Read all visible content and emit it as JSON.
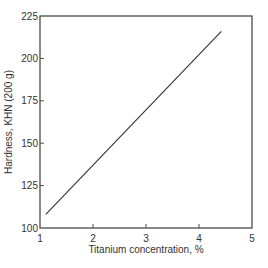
{
  "chart_data": {
    "type": "line",
    "title": "",
    "xlabel": "Titanium concentration, %",
    "ylabel": "Hardness, KHN (200 g)",
    "xlim": [
      1,
      5
    ],
    "ylim": [
      100,
      225
    ],
    "xticks": [
      1,
      2,
      3,
      4,
      5
    ],
    "yticks": [
      100,
      125,
      150,
      175,
      200,
      225
    ],
    "grid": false,
    "legend": null,
    "series": [
      {
        "name": "Hardness vs Titanium concentration",
        "x": [
          1.11,
          4.42
        ],
        "y": [
          108,
          216
        ]
      }
    ]
  },
  "colors": {
    "line": "#3a3a3a",
    "frame": "#4a4a4a",
    "text": "#333333",
    "background": "#ffffff"
  }
}
